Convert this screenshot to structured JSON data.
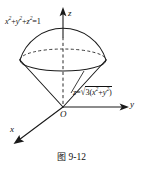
{
  "figure": {
    "caption_prefix": "图",
    "caption_number": "9-12",
    "caption_full": "图 9-12",
    "background_color": "#ffffff",
    "ink_color": "#1a1a1a"
  },
  "axes": {
    "z": {
      "label": "z",
      "direction": "up",
      "origin_px": [
        63,
        107
      ],
      "tip_px": [
        63,
        8
      ]
    },
    "y": {
      "label": "y",
      "direction": "right",
      "origin_px": [
        63,
        107
      ],
      "tip_px": [
        128,
        107
      ]
    },
    "x": {
      "label": "x",
      "direction": "down-left",
      "origin_px": [
        63,
        107
      ],
      "tip_px": [
        14,
        143
      ]
    },
    "origin_label": "O"
  },
  "equations": {
    "sphere": {
      "text": "x^2+y^2+z^2=1",
      "parts": {
        "x": "x",
        "y": "y",
        "z": "z",
        "exp": "2",
        "rhs": "1"
      },
      "description": "unit sphere"
    },
    "cone": {
      "text": "z=sqrt(3(x^2+y^2))",
      "parts": {
        "lhs": "z",
        "coefficient": "3",
        "x": "x",
        "y": "y",
        "exp": "2"
      },
      "description": "cone surface"
    }
  },
  "shapes": {
    "sphere_cap": {
      "type": "arc",
      "left_px": [
        20,
        60
      ],
      "apex_px": [
        63,
        37
      ],
      "right_px": [
        106,
        60
      ],
      "style": "solid"
    },
    "intersection_ellipse": {
      "center_px": [
        63,
        60
      ],
      "rx": 43,
      "ry": 11,
      "front_style": "solid",
      "back_style": "dashed"
    },
    "cone": {
      "apex_px": [
        63,
        107
      ],
      "left_rim_px": [
        20,
        60
      ],
      "right_rim_px": [
        106,
        60
      ],
      "style": "solid"
    },
    "axis_inside_solid": {
      "from_px": [
        63,
        37
      ],
      "to_px": [
        63,
        107
      ],
      "style": "dashed"
    },
    "cone_leader": {
      "from_px": [
        72,
        92
      ],
      "to_px": [
        84,
        72
      ],
      "style": "solid"
    }
  }
}
